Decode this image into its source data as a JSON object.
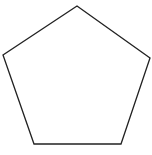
{
  "diagram": {
    "shape": "pentagon",
    "sides": 5,
    "stroke_color": "#222222",
    "fill_color": "#ffffff",
    "stroke_width": 1.3,
    "vertices": [
      {
        "x": 77,
        "y": 6
      },
      {
        "x": 150,
        "y": 58
      },
      {
        "x": 121,
        "y": 144
      },
      {
        "x": 34,
        "y": 144
      },
      {
        "x": 3,
        "y": 55
      }
    ]
  }
}
